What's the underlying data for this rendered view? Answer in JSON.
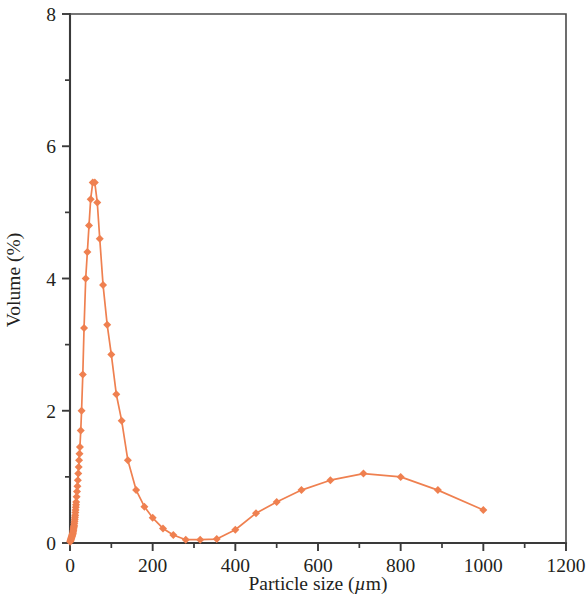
{
  "chart_data": {
    "type": "line",
    "title": "",
    "xlabel": "Particle size (µm)",
    "ylabel": "Volume (%)",
    "xlim": [
      0,
      1200
    ],
    "ylim": [
      0,
      8
    ],
    "x_ticks": [
      0,
      200,
      400,
      600,
      800,
      1000,
      1200
    ],
    "x_tick_labels": [
      "0",
      "200",
      "400",
      "600",
      "800",
      "1000",
      "1200"
    ],
    "x_minor_ticks": [
      100,
      300,
      500,
      700,
      900,
      1100
    ],
    "y_ticks": [
      0,
      2,
      4,
      6,
      8
    ],
    "y_tick_labels": [
      "0",
      "2",
      "4",
      "6",
      "8"
    ],
    "y_minor_ticks": [
      1,
      3,
      5,
      7
    ],
    "grid": false,
    "legend": "none",
    "series": [
      {
        "name": "Volume distribution",
        "color": "#ef8050",
        "marker": "diamond",
        "marker_size": 8,
        "x": [
          0.5,
          1.0,
          1.5,
          2.0,
          2.5,
          3.0,
          3.5,
          4.0,
          4.5,
          5.0,
          5.5,
          6.0,
          6.5,
          7.0,
          7.5,
          8.0,
          8.5,
          9.0,
          9.5,
          10.0,
          10.5,
          11.0,
          11.5,
          12.0,
          12.5,
          13.0,
          13.5,
          14.0,
          14.5,
          15.0,
          16.0,
          17.0,
          18.0,
          19.0,
          20.0,
          21.0,
          22.0,
          23.0,
          24.0,
          26.0,
          28.0,
          31.0,
          34.0,
          38.0,
          42.0,
          46.0,
          50.0,
          55.0,
          60.0,
          66.0,
          72.0,
          80.0,
          90.0,
          100.0,
          112.0,
          125.0,
          140.0,
          160.0,
          180.0,
          200.0,
          225.0,
          250.0,
          280.0,
          315.0,
          355.0,
          400.0,
          450.0,
          500.0,
          560.0,
          630.0,
          710.0,
          800.0,
          890.0,
          1000.0
        ],
        "y": [
          0.02,
          0.03,
          0.04,
          0.05,
          0.06,
          0.07,
          0.08,
          0.09,
          0.1,
          0.11,
          0.12,
          0.13,
          0.14,
          0.15,
          0.17,
          0.19,
          0.21,
          0.23,
          0.25,
          0.27,
          0.3,
          0.33,
          0.36,
          0.39,
          0.42,
          0.46,
          0.5,
          0.54,
          0.58,
          0.62,
          0.7,
          0.78,
          0.86,
          0.95,
          1.05,
          1.15,
          1.25,
          1.35,
          1.45,
          1.7,
          2.0,
          2.55,
          3.25,
          4.0,
          4.4,
          4.8,
          5.2,
          5.45,
          5.45,
          5.15,
          4.6,
          3.9,
          3.3,
          2.85,
          2.25,
          1.85,
          1.25,
          0.8,
          0.55,
          0.38,
          0.22,
          0.12,
          0.05,
          0.05,
          0.06,
          0.2,
          0.45,
          0.62,
          0.8,
          0.95,
          1.05,
          1.0,
          0.8,
          0.5
        ]
      }
    ],
    "annotations": {
      "primary_peak_x": 55,
      "primary_peak_y": 5.45,
      "valley_x_range": [
        280,
        355
      ],
      "valley_y": 0.05,
      "secondary_peak_x": 710,
      "secondary_peak_y": 1.05
    },
    "colors": {
      "series": "#ef8050",
      "axis": "#3a3a3a",
      "text": "#231f20",
      "background": "#ffffff"
    }
  }
}
